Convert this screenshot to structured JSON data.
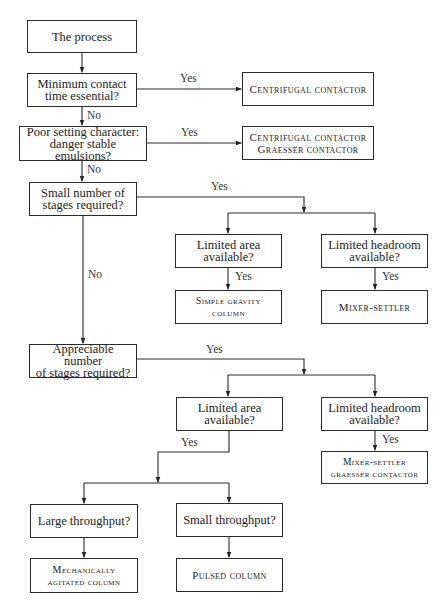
{
  "diagram": {
    "nodes": {
      "start": "The process",
      "q_min_contact": "Minimum contact\ntime essential?",
      "r_centrifugal": "Centrifugal contactor",
      "q_poor_settling": "Poor setting character:\ndanger stable emulsions?",
      "r_centrifugal_graesser": "Centrifugal contactor\nGraesser contactor",
      "q_small_stages": "Small number of\nstages required?",
      "q_small_limited_area": "Limited area\navailable?",
      "q_small_limited_headroom": "Limited headroom\navailable?",
      "r_simple_gravity": "Simple gravity\ncolumn",
      "r_mixer_settler": "Mixer-settler",
      "q_appreciable_stages": "Appreciable number\nof stages required?",
      "q_app_limited_area": "Limited area\navailable?",
      "q_app_limited_headroom": "Limited headroom\navailable?",
      "r_mixer_settler_graesser": "Mixer-settler\ngraesser contactor",
      "q_large_throughput": "Large throughput?",
      "q_small_throughput": "Small throughput?",
      "r_mech_agitated": "Mechanically\nagitated column",
      "r_pulsed": "Pulsed column"
    },
    "labels": {
      "yes": "Yes",
      "no": "No"
    },
    "edges": [
      {
        "from": "start",
        "to": "q_min_contact",
        "label": ""
      },
      {
        "from": "q_min_contact",
        "to": "r_centrifugal",
        "label": "Yes"
      },
      {
        "from": "q_min_contact",
        "to": "q_poor_settling",
        "label": "No"
      },
      {
        "from": "q_poor_settling",
        "to": "r_centrifugal_graesser",
        "label": "Yes"
      },
      {
        "from": "q_poor_settling",
        "to": "q_small_stages",
        "label": "No"
      },
      {
        "from": "q_small_stages",
        "to": "q_small_limited_area",
        "label": "Yes"
      },
      {
        "from": "q_small_stages",
        "to": "q_small_limited_headroom",
        "label": "Yes"
      },
      {
        "from": "q_small_limited_area",
        "to": "r_simple_gravity",
        "label": "Yes"
      },
      {
        "from": "q_small_limited_headroom",
        "to": "r_mixer_settler",
        "label": "Yes"
      },
      {
        "from": "q_small_stages",
        "to": "q_appreciable_stages",
        "label": "No"
      },
      {
        "from": "q_appreciable_stages",
        "to": "q_app_limited_area",
        "label": "Yes"
      },
      {
        "from": "q_appreciable_stages",
        "to": "q_app_limited_headroom",
        "label": "Yes"
      },
      {
        "from": "q_app_limited_headroom",
        "to": "r_mixer_settler_graesser",
        "label": "Yes"
      },
      {
        "from": "q_app_limited_area",
        "to": "q_large_throughput",
        "label": "Yes"
      },
      {
        "from": "q_app_limited_area",
        "to": "q_small_throughput",
        "label": "Yes"
      },
      {
        "from": "q_large_throughput",
        "to": "r_mech_agitated",
        "label": ""
      },
      {
        "from": "q_small_throughput",
        "to": "r_pulsed",
        "label": ""
      }
    ]
  }
}
